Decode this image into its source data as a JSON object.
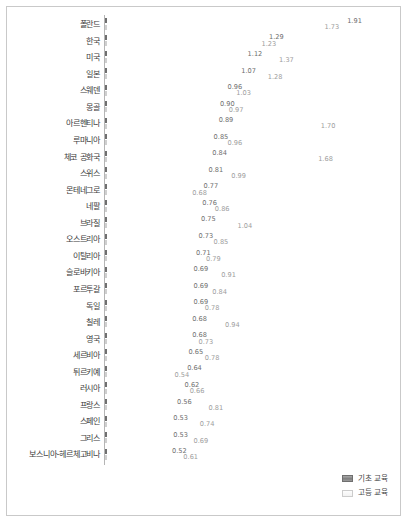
{
  "chart_data": {
    "type": "bar",
    "orientation": "horizontal",
    "title": "",
    "xlabel": "",
    "ylabel": "",
    "xlim": [
      0,
      2.0
    ],
    "grid": false,
    "legend_position": "bottom-right",
    "categories": [
      "폴란드",
      "한국",
      "미국",
      "일본",
      "스웨덴",
      "몽골",
      "아르헨티나",
      "루마니아",
      "체코 공화국",
      "스위스",
      "몬테네그로",
      "네팔",
      "브라질",
      "오스트리아",
      "이탈리아",
      "슬로바키아",
      "포르투갈",
      "독일",
      "칠레",
      "영국",
      "세르비아",
      "튀르키예",
      "러시아",
      "프랑스",
      "스페인",
      "그리스",
      "보스니아-헤르체고비나"
    ],
    "series": [
      {
        "name": "기초 교육",
        "color": "#8f8f8f",
        "values": [
          1.91,
          1.29,
          1.12,
          1.07,
          0.96,
          0.9,
          0.89,
          0.85,
          0.84,
          0.81,
          0.77,
          0.76,
          0.75,
          0.73,
          0.71,
          0.69,
          0.69,
          0.69,
          0.68,
          0.68,
          0.65,
          0.64,
          0.62,
          0.56,
          0.53,
          0.53,
          0.52
        ],
        "labels": [
          "1.91",
          "1.29",
          "1.12",
          "1.07",
          "0.96",
          "0.90",
          "0.89",
          "0.85",
          "0.84",
          "0.81",
          "0.77",
          "0.76",
          "0.75",
          "0.73",
          "0.71",
          "0.69",
          "0.69",
          "0.69",
          "0.68",
          "0.68",
          "0.65",
          "0.64",
          "0.62",
          "0.56",
          "0.53",
          "0.53",
          "0.52"
        ]
      },
      {
        "name": "고등 교육",
        "color": "#f2f2f2",
        "values": [
          1.73,
          1.23,
          1.37,
          1.28,
          1.03,
          0.97,
          1.7,
          0.96,
          1.68,
          0.99,
          0.68,
          0.86,
          1.04,
          0.85,
          0.79,
          0.91,
          0.84,
          0.78,
          0.94,
          0.73,
          0.78,
          0.54,
          0.66,
          0.81,
          0.74,
          0.69,
          0.61
        ],
        "labels": [
          "1.73",
          "1.23",
          "1.37",
          "1.28",
          "1.03",
          "0.97",
          "1.70",
          "0.96",
          "1.68",
          "0.99",
          "0.68",
          "0.86",
          "1.04",
          "0.85",
          "0.79",
          "0.91",
          "0.84",
          "0.78",
          "0.94",
          "0.73",
          "0.78",
          "0.54",
          "0.66",
          "0.81",
          "0.74",
          "0.69",
          "0.61"
        ]
      }
    ]
  },
  "legend": {
    "items": [
      {
        "label": "기초 교육"
      },
      {
        "label": "고등 교육"
      }
    ]
  }
}
